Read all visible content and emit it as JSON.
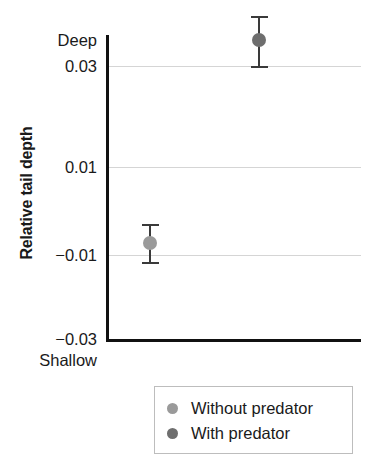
{
  "chart_data": {
    "type": "scatter",
    "title": "",
    "xlabel": "",
    "ylabel": "Relative tail depth",
    "ylim": [
      -0.03,
      0.045
    ],
    "grid": true,
    "legend_position": "bottom-right",
    "y_tick_labels": [
      "0.03",
      "0.01",
      "−0.01",
      "−0.03"
    ],
    "y_tick_values": [
      0.03,
      0.01,
      -0.01,
      -0.03
    ],
    "axis_top_label": "Deep",
    "axis_bottom_label": "Shallow",
    "categories": [
      "Without predator",
      "With predator"
    ],
    "series": [
      {
        "name": "Without predator",
        "color": "#9a9a9a",
        "value": -0.0075,
        "error_low": -0.0115,
        "error_high": -0.0035
      },
      {
        "name": "With predator",
        "color": "#6e6e6e",
        "value": 0.0355,
        "error_low": 0.03,
        "error_high": 0.0405
      }
    ]
  },
  "legend": {
    "items": [
      {
        "label": "Without predator",
        "color": "#9a9a9a"
      },
      {
        "label": "With predator",
        "color": "#6e6e6e"
      }
    ]
  },
  "axis": {
    "y_title": "Relative tail depth",
    "top_label": "Deep",
    "bottom_label": "Shallow",
    "ticks": [
      {
        "label": "0.03",
        "value": 0.03
      },
      {
        "label": "0.01",
        "value": 0.01
      },
      {
        "label": "−0.01",
        "value": -0.01
      },
      {
        "label": "−0.03",
        "value": -0.03
      }
    ]
  },
  "colors": {
    "axis": "#111111",
    "gridline": "#d5d5d5",
    "error_bar": "#3a3a3a",
    "legend_border": "#bdbdbd",
    "background": "#ffffff"
  }
}
